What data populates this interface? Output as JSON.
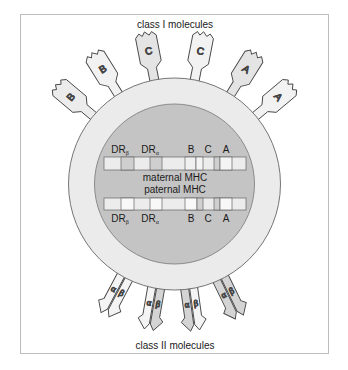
{
  "labels": {
    "class_I": "class I molecules",
    "class_II": "class II molecules",
    "maternal": "maternal MHC",
    "paternal": "paternal MHC"
  },
  "maternal_loci": [
    {
      "name": "DR",
      "sub": "β"
    },
    {
      "name": "DR",
      "sub": "α"
    },
    {
      "name": "B",
      "sub": ""
    },
    {
      "name": "C",
      "sub": ""
    },
    {
      "name": "A",
      "sub": ""
    }
  ],
  "paternal_loci": [
    {
      "name": "DR",
      "sub": "β"
    },
    {
      "name": "DR",
      "sub": "α"
    },
    {
      "name": "B",
      "sub": ""
    },
    {
      "name": "C",
      "sub": ""
    },
    {
      "name": "A",
      "sub": ""
    }
  ],
  "class_I_molecules": [
    "B",
    "B",
    "C",
    "C",
    "A",
    "A"
  ],
  "class_II_molecules": [
    {
      "alpha": "α",
      "beta": "β"
    },
    {
      "alpha": "α",
      "beta": "β"
    },
    {
      "alpha": "α",
      "beta": "β"
    },
    {
      "alpha": "α",
      "beta": "β"
    }
  ],
  "colors": {
    "frame_border": "#bdbdbd",
    "cell_outer": "#ebebeb",
    "nucleus": "#c4c4c4",
    "outline": "#555555",
    "molecule_light": "#ececec",
    "molecule_mid": "#d6d6d6",
    "chrom_light": "#ececec",
    "chrom_mid": "#cfcfcf",
    "chrom_white": "#f8f8f8"
  }
}
